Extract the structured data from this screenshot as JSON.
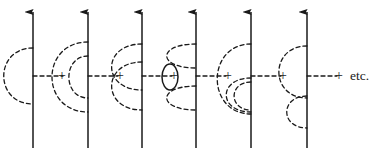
{
  "figure": {
    "type": "feynman-diagram-series",
    "background_color": "#ffffff",
    "ink_color": "#1a1a1a",
    "width": 382,
    "height": 152,
    "fermion_line": {
      "style": "solid",
      "direction": "upward",
      "arrowhead": "filled-triangle",
      "stroke_width": 1.5,
      "top_y": 12,
      "bottom_y": 148
    },
    "photon_line": {
      "style": "dashed",
      "dash_pattern": "4 3",
      "stroke_width": 1.3
    },
    "vertex_y": 76,
    "external_photon": {
      "style": "dashed",
      "length": 30
    },
    "terms": [
      {
        "index": 1,
        "name": "first-order-self-energy",
        "line_x": 33,
        "label": "single photon arc",
        "arcs": [
          {
            "name": "outer-arc",
            "top_y": 48,
            "bottom_y": 104,
            "bulge": 26,
            "style": "dashed"
          }
        ],
        "loops": [],
        "external_photon": true,
        "plus_after": true,
        "plus_x": 62
      },
      {
        "index": 2,
        "name": "nested-photon-arcs",
        "line_x": 88,
        "label": "two nested photon arcs",
        "arcs": [
          {
            "name": "outer-arc",
            "top_y": 42,
            "bottom_y": 112,
            "bulge": 32,
            "style": "dashed"
          },
          {
            "name": "inner-arc",
            "top_y": 56,
            "bottom_y": 98,
            "bulge": 17,
            "style": "dashed"
          }
        ],
        "loops": [],
        "external_photon": true,
        "plus_after": true,
        "plus_x": 120
      },
      {
        "index": 3,
        "name": "crossed-photon-arcs",
        "line_x": 142,
        "label": "two crossed photon arcs",
        "arcs": [
          {
            "name": "crossed-arc-upper",
            "top_y": 44,
            "bottom_y": 90,
            "bulge": 27,
            "style": "dashed"
          },
          {
            "name": "crossed-arc-lower",
            "top_y": 62,
            "bottom_y": 110,
            "bulge": 27,
            "style": "dashed"
          }
        ],
        "loops": [],
        "external_photon": true,
        "plus_after": true,
        "plus_x": 174
      },
      {
        "index": 4,
        "name": "vacuum-polarization-insertion",
        "line_x": 196,
        "label": "photon arc with fermion loop insertion",
        "arcs": [
          {
            "name": "arc-upper-segment",
            "top_y": 44,
            "bottom_y": 68,
            "bulge": 26,
            "style": "dashed"
          },
          {
            "name": "arc-lower-segment",
            "top_y": 86,
            "bottom_y": 110,
            "bulge": 26,
            "style": "dashed"
          }
        ],
        "loops": [
          {
            "name": "fermion-loop",
            "cx": 170,
            "cy": 77,
            "rx": 8,
            "ry": 13,
            "style": "solid"
          }
        ],
        "external_photon": true,
        "plus_after": true,
        "plus_x": 228
      },
      {
        "index": 5,
        "name": "nested-arc-with-lower-subloop",
        "line_x": 251,
        "label": "photon arc with nested lower sub-arcs",
        "arcs": [
          {
            "name": "outer-arc",
            "top_y": 44,
            "bottom_y": 114,
            "bulge": 30,
            "style": "dashed"
          },
          {
            "name": "inner-lower-arc",
            "top_y": 78,
            "bottom_y": 112,
            "bulge": 22,
            "style": "dashed"
          },
          {
            "name": "inner-lower-arc-2",
            "top_y": 82,
            "bottom_y": 110,
            "bulge": 15,
            "style": "dashed"
          }
        ],
        "loops": [],
        "external_photon": true,
        "plus_after": true,
        "plus_x": 283
      },
      {
        "index": 6,
        "name": "stacked-photon-arcs",
        "line_x": 307,
        "label": "two stacked photon arcs",
        "arcs": [
          {
            "name": "upper-arc",
            "top_y": 46,
            "bottom_y": 98,
            "bulge": 25,
            "style": "dashed"
          },
          {
            "name": "lower-arc",
            "top_y": 96,
            "bottom_y": 128,
            "bulge": 18,
            "style": "dashed"
          }
        ],
        "loops": [],
        "external_photon": true,
        "plus_after": true,
        "plus_x": 339
      }
    ],
    "plus_sign": "+",
    "trailing_text": "etc.",
    "trailing_text_x": 350,
    "trailing_text_y": 76
  }
}
